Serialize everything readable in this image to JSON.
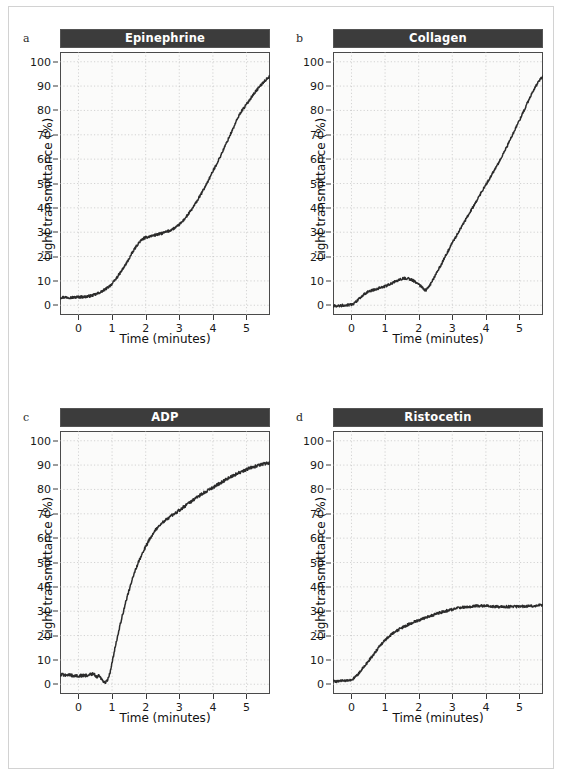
{
  "figure": {
    "background_color": "#ffffff",
    "border_color": "#d2d2d2",
    "title_bar_color": "#3c3c3c",
    "title_text_color": "#ffffff",
    "trace_color": "#2b2b2b",
    "grid_color": "#b9b9b9",
    "plot_background": "#fbfbfa"
  },
  "axes": {
    "x_title": "Time (minutes)",
    "y_title": "Light transmittance (%)",
    "x_ticks": [
      0,
      1,
      2,
      3,
      4,
      5
    ],
    "y_ticks": [
      0,
      10,
      20,
      30,
      40,
      50,
      60,
      70,
      80,
      90,
      100
    ],
    "xlim": [
      -0.55,
      5.7
    ],
    "ylim": [
      -4,
      104
    ],
    "grid": true
  },
  "panels": [
    {
      "letter": "a",
      "title": "Epinephrine"
    },
    {
      "letter": "b",
      "title": "Collagen"
    },
    {
      "letter": "c",
      "title": "ADP"
    },
    {
      "letter": "d",
      "title": "Ristocetin"
    }
  ],
  "chart_data": [
    {
      "type": "line",
      "panel": "a",
      "title": "Epinephrine",
      "xlabel": "Time (minutes)",
      "ylabel": "Light transmittance (%)",
      "xlim": [
        -0.55,
        5.7
      ],
      "ylim": [
        -4,
        104
      ],
      "grid": true,
      "legend": "none",
      "noise_amplitude": 0.5,
      "x": [
        -0.55,
        -0.4,
        -0.2,
        0.0,
        0.2,
        0.4,
        0.6,
        0.8,
        1.0,
        1.15,
        1.3,
        1.45,
        1.6,
        1.75,
        1.9,
        2.0,
        2.15,
        2.3,
        2.5,
        2.7,
        2.9,
        3.0,
        3.2,
        3.4,
        3.6,
        3.8,
        4.0,
        4.2,
        4.4,
        4.6,
        4.8,
        5.0,
        5.2,
        5.4,
        5.7
      ],
      "y": [
        3.2,
        3.3,
        3.2,
        3.4,
        3.5,
        4.0,
        5.0,
        6.6,
        8.8,
        11.5,
        14.5,
        17.8,
        21.5,
        24.8,
        27.0,
        27.8,
        28.4,
        28.9,
        29.6,
        30.6,
        32.0,
        33.2,
        36.2,
        40.0,
        44.5,
        49.5,
        55.0,
        60.5,
        66.5,
        72.5,
        78.5,
        82.5,
        86.5,
        90.0,
        94.0
      ]
    },
    {
      "type": "line",
      "panel": "b",
      "title": "Collagen",
      "xlabel": "Time (minutes)",
      "ylabel": "Light transmittance (%)",
      "xlim": [
        -0.55,
        5.7
      ],
      "ylim": [
        -4,
        104
      ],
      "grid": true,
      "legend": "none",
      "noise_amplitude": 0.5,
      "x": [
        -0.55,
        -0.4,
        -0.2,
        0.0,
        0.15,
        0.3,
        0.45,
        0.6,
        0.8,
        1.0,
        1.2,
        1.4,
        1.55,
        1.7,
        1.85,
        2.0,
        2.1,
        2.2,
        2.3,
        2.45,
        2.6,
        2.8,
        3.0,
        3.2,
        3.4,
        3.6,
        3.8,
        4.0,
        4.2,
        4.4,
        4.6,
        4.8,
        5.0,
        5.2,
        5.4,
        5.7
      ],
      "y": [
        -0.3,
        -0.2,
        0.0,
        0.3,
        1.6,
        3.6,
        5.2,
        6.1,
        7.0,
        7.8,
        9.0,
        10.3,
        11.1,
        10.9,
        10.0,
        8.6,
        7.4,
        6.3,
        7.6,
        11.2,
        15.0,
        20.3,
        25.5,
        30.4,
        35.2,
        40.0,
        44.8,
        49.5,
        54.2,
        59.0,
        64.5,
        70.2,
        76.0,
        82.0,
        88.0,
        94.0
      ]
    },
    {
      "type": "line",
      "panel": "c",
      "title": "ADP",
      "xlabel": "Time (minutes)",
      "ylabel": "Light transmittance (%)",
      "xlim": [
        -0.55,
        5.7
      ],
      "ylim": [
        -4,
        104
      ],
      "grid": true,
      "legend": "none",
      "noise_amplitude": 0.6,
      "x": [
        -0.55,
        -0.35,
        -0.15,
        0.05,
        0.25,
        0.45,
        0.55,
        0.62,
        0.7,
        0.78,
        0.85,
        0.92,
        1.0,
        1.1,
        1.25,
        1.4,
        1.6,
        1.8,
        2.0,
        2.2,
        2.4,
        2.6,
        2.8,
        3.0,
        3.2,
        3.4,
        3.6,
        3.8,
        4.0,
        4.2,
        4.5,
        4.8,
        5.1,
        5.4,
        5.7
      ],
      "y": [
        4.0,
        3.8,
        3.6,
        3.5,
        3.7,
        4.2,
        3.0,
        3.4,
        2.0,
        0.9,
        1.4,
        4.0,
        9.0,
        16.0,
        25.0,
        33.5,
        43.0,
        50.5,
        56.5,
        61.5,
        65.0,
        67.5,
        69.5,
        71.5,
        73.5,
        75.5,
        77.5,
        79.2,
        80.8,
        82.5,
        85.0,
        87.0,
        88.8,
        90.0,
        91.0
      ]
    },
    {
      "type": "line",
      "panel": "d",
      "title": "Ristocetin",
      "xlabel": "Time (minutes)",
      "ylabel": "Light transmittance (%)",
      "xlim": [
        -0.55,
        5.7
      ],
      "ylim": [
        -4,
        104
      ],
      "grid": true,
      "legend": "none",
      "noise_amplitude": 0.5,
      "x": [
        -0.55,
        -0.35,
        -0.15,
        0.0,
        0.15,
        0.3,
        0.45,
        0.6,
        0.75,
        0.9,
        1.05,
        1.2,
        1.35,
        1.5,
        1.7,
        1.9,
        2.1,
        2.3,
        2.5,
        2.7,
        2.9,
        3.1,
        3.3,
        3.6,
        3.9,
        4.2,
        4.5,
        4.8,
        5.1,
        5.4,
        5.7
      ],
      "y": [
        1.2,
        1.3,
        1.5,
        1.8,
        3.5,
        6.0,
        8.6,
        11.2,
        14.0,
        16.6,
        18.8,
        20.6,
        22.0,
        23.2,
        24.6,
        25.8,
        26.8,
        27.8,
        28.8,
        29.7,
        30.4,
        31.2,
        31.6,
        32.0,
        32.2,
        32.0,
        31.8,
        31.9,
        32.0,
        32.2,
        32.6
      ]
    }
  ]
}
